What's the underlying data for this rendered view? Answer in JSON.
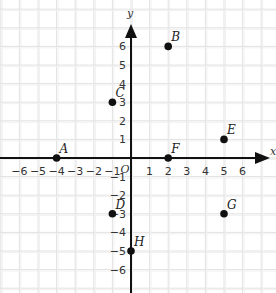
{
  "diagram": {
    "type": "coordinate-plane",
    "x_axis_label": "x",
    "y_axis_label": "y",
    "origin_label": "O",
    "x_range": [
      -7,
      7
    ],
    "y_range": [
      -7,
      7
    ],
    "x_ticks": [
      -6,
      -5,
      -4,
      -3,
      -2,
      -1,
      1,
      2,
      3,
      4,
      5,
      6
    ],
    "y_ticks": [
      6,
      5,
      4,
      3,
      2,
      1,
      -1,
      -2,
      -3,
      -4,
      -5,
      -6
    ],
    "grid": true,
    "colors": {
      "grid": "#e2e2e2",
      "axis": "#111111",
      "point": "#111111"
    },
    "points": [
      {
        "label": "A",
        "x": -4,
        "y": 0
      },
      {
        "label": "B",
        "x": 2,
        "y": 6
      },
      {
        "label": "C",
        "x": -1,
        "y": 3
      },
      {
        "label": "D",
        "x": -1,
        "y": -3
      },
      {
        "label": "E",
        "x": 5,
        "y": 1
      },
      {
        "label": "F",
        "x": 2,
        "y": 0
      },
      {
        "label": "G",
        "x": 5,
        "y": -3
      },
      {
        "label": "H",
        "x": 0,
        "y": -5
      }
    ]
  }
}
